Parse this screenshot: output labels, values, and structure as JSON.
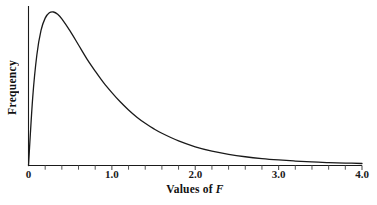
{
  "chart_data": {
    "type": "line",
    "title": "",
    "subtitle": "",
    "xlabel_plain": "Values of F",
    "xlabel_prefix": "Values of ",
    "xlabel_variable": "F",
    "ylabel": "Frequency",
    "xlim": [
      0,
      4.0
    ],
    "ylim": [
      0,
      1.0
    ],
    "grid": false,
    "legend": false,
    "legend_position": "none",
    "xticks_major": [
      "0",
      "1.0",
      "2.0",
      "3.0",
      "4.0"
    ],
    "xticks_major_values": [
      0,
      1.0,
      2.0,
      3.0,
      4.0
    ],
    "xticks_minor_values": [
      0.2,
      0.4,
      0.6,
      0.8,
      1.2,
      1.4,
      1.6,
      1.8,
      2.2,
      2.4,
      2.6,
      2.8,
      3.2,
      3.4,
      3.6,
      3.8
    ],
    "yticks": [],
    "yticklabels": [],
    "annotations": [],
    "series": [
      {
        "name": "F distribution density",
        "color": "#1a1a1a",
        "line_width": 1.3,
        "x": [
          0.0,
          0.05,
          0.1,
          0.15,
          0.2,
          0.25,
          0.3,
          0.35,
          0.4,
          0.5,
          0.6,
          0.7,
          0.8,
          0.9,
          1.0,
          1.1,
          1.2,
          1.3,
          1.4,
          1.5,
          1.6,
          1.8,
          2.0,
          2.2,
          2.4,
          2.6,
          2.8,
          3.0,
          3.2,
          3.4,
          3.6,
          3.8,
          4.0
        ],
        "y": [
          0.0,
          0.44,
          0.72,
          0.88,
          0.96,
          0.995,
          1.0,
          0.985,
          0.955,
          0.875,
          0.785,
          0.695,
          0.615,
          0.54,
          0.475,
          0.415,
          0.362,
          0.315,
          0.275,
          0.24,
          0.21,
          0.16,
          0.122,
          0.094,
          0.073,
          0.057,
          0.045,
          0.036,
          0.029,
          0.023,
          0.019,
          0.016,
          0.013
        ]
      }
    ]
  },
  "axes": {
    "x_axis_color": "#1a1a1a",
    "y_axis_color": "#1a1a1a",
    "tick_color": "#555555",
    "background": "#ffffff"
  }
}
